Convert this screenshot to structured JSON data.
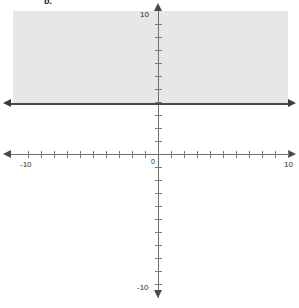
{
  "problem": {
    "label": "b."
  },
  "graph": {
    "origin_label": "0",
    "x_axis": {
      "min_label": "-10",
      "max_label": "10"
    },
    "y_axis": {
      "min_label": "-10",
      "max_label": "10"
    }
  },
  "colors": {
    "shade_fill": "#e7e7e7",
    "axis": "#6e6e6e",
    "tick": "#7a7a7a",
    "boundary": "#4a4a4a",
    "arrow": "#4a4a4a",
    "background": "#ffffff",
    "text": "#2a2a2a"
  },
  "chart_data": {
    "type": "line",
    "title": "b.",
    "xlabel": "",
    "ylabel": "",
    "xlim": [
      -10,
      10
    ],
    "ylim": [
      -10,
      10
    ],
    "x_ticks": [
      -10,
      -9,
      -8,
      -7,
      -6,
      -5,
      -4,
      -3,
      -2,
      -1,
      0,
      1,
      2,
      3,
      4,
      5,
      6,
      7,
      8,
      9,
      10
    ],
    "y_ticks": [
      -10,
      -9,
      -8,
      -7,
      -6,
      -5,
      -4,
      -3,
      -2,
      -1,
      0,
      1,
      2,
      3,
      4,
      5,
      6,
      7,
      8,
      9,
      10
    ],
    "x_tick_labels": [
      "-10",
      "10"
    ],
    "y_tick_labels": [
      "-10",
      "10"
    ],
    "grid": false,
    "legend": null,
    "axes_style": "arrows-both-ends",
    "series": [
      {
        "name": "boundary",
        "type": "horizontal-line",
        "equation": "y = 4",
        "y": 4,
        "line_style": "solid",
        "inclusive": true,
        "arrows": "both",
        "color": "#4a4a4a"
      },
      {
        "name": "solution-region",
        "type": "half-plane",
        "inequality": "y >= 4",
        "shaded_side": "above",
        "fill": "#e7e7e7",
        "x_extent": [
          -10,
          10
        ],
        "y_extent": [
          4,
          10
        ]
      }
    ],
    "annotations": []
  }
}
